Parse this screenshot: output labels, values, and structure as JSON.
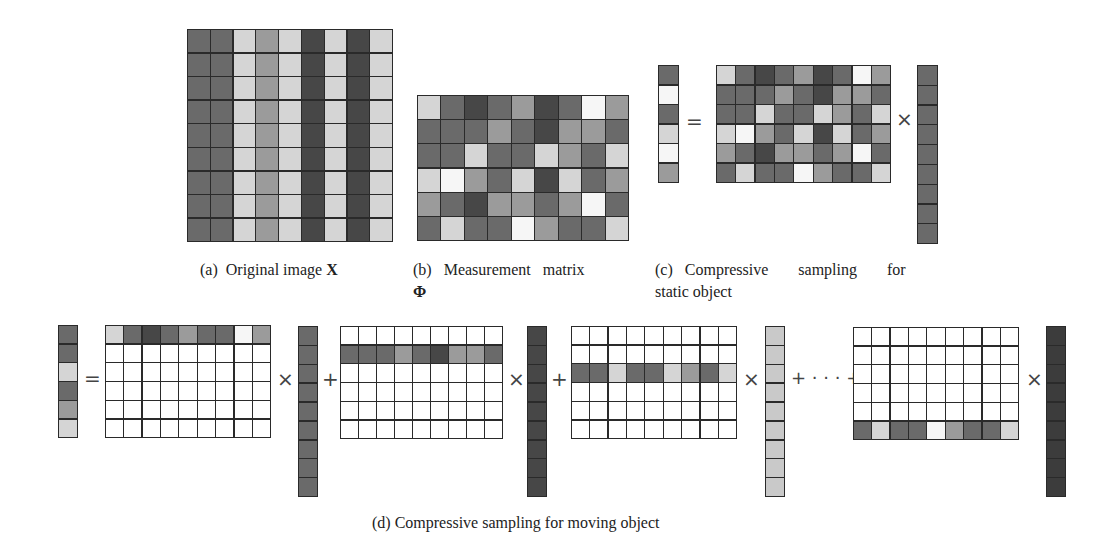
{
  "palette": {
    "D": "#474747",
    "M": "#6a6a6a",
    "G": "#9b9b9b",
    "L": "#d5d5d5",
    "W": "#f6f6f6",
    "E": "#ffffff",
    "VD": "#3c3c3c",
    "VL": "#c9c9c9"
  },
  "panels": {
    "a": {
      "caption_prefix": "(a)",
      "caption_text": "Original image",
      "caption_symbol": "X",
      "columns": [
        "M",
        "M",
        "L",
        "G",
        "L",
        "D",
        "L",
        "D",
        "L"
      ],
      "rows": 9
    },
    "b": {
      "caption_prefix": "(b)",
      "caption_text": "Measurement matrix",
      "caption_symbol": "Φ",
      "matrix": [
        [
          "L",
          "M",
          "D",
          "M",
          "G",
          "D",
          "M",
          "W",
          "G"
        ],
        [
          "M",
          "M",
          "M",
          "G",
          "M",
          "D",
          "G",
          "G",
          "M"
        ],
        [
          "M",
          "M",
          "L",
          "M",
          "M",
          "L",
          "G",
          "M",
          "L"
        ],
        [
          "L",
          "W",
          "G",
          "M",
          "L",
          "D",
          "L",
          "M",
          "G"
        ],
        [
          "G",
          "M",
          "D",
          "G",
          "G",
          "M",
          "G",
          "W",
          "M"
        ],
        [
          "M",
          "L",
          "M",
          "M",
          "W",
          "G",
          "M",
          "M",
          "L"
        ]
      ]
    },
    "c": {
      "caption_prefix": "(c)",
      "caption_line1": "Compressive sampling for",
      "caption_line2": "static object",
      "output_vector": [
        "M",
        "W",
        "M",
        "L",
        "W",
        "G"
      ],
      "equals": "=",
      "times": "×",
      "input_vector": [
        "M",
        "M",
        "M",
        "M",
        "M",
        "M",
        "M",
        "M",
        "M"
      ]
    },
    "d": {
      "caption": "(d) Compressive sampling for moving object",
      "output_vector": [
        "M",
        "M",
        "L",
        "M",
        "G",
        "L"
      ],
      "equals": "=",
      "times": "×",
      "plus": "+",
      "ellipsis_plus": "+ · · · +",
      "terms": [
        {
          "active_row": 0,
          "row_values": [
            "L",
            "M",
            "D",
            "M",
            "G",
            "M",
            "M",
            "W",
            "G"
          ],
          "vector_shade": "M"
        },
        {
          "active_row": 1,
          "row_values": [
            "M",
            "M",
            "M",
            "G",
            "M",
            "D",
            "G",
            "G",
            "M"
          ],
          "vector_shade": "D"
        },
        {
          "active_row": 2,
          "row_values": [
            "M",
            "M",
            "L",
            "M",
            "M",
            "L",
            "G",
            "M",
            "L"
          ],
          "vector_shade": "VL"
        },
        {
          "active_row": 5,
          "row_values": [
            "M",
            "L",
            "M",
            "M",
            "W",
            "G",
            "M",
            "M",
            "L"
          ],
          "vector_shade": "VD"
        }
      ]
    }
  }
}
